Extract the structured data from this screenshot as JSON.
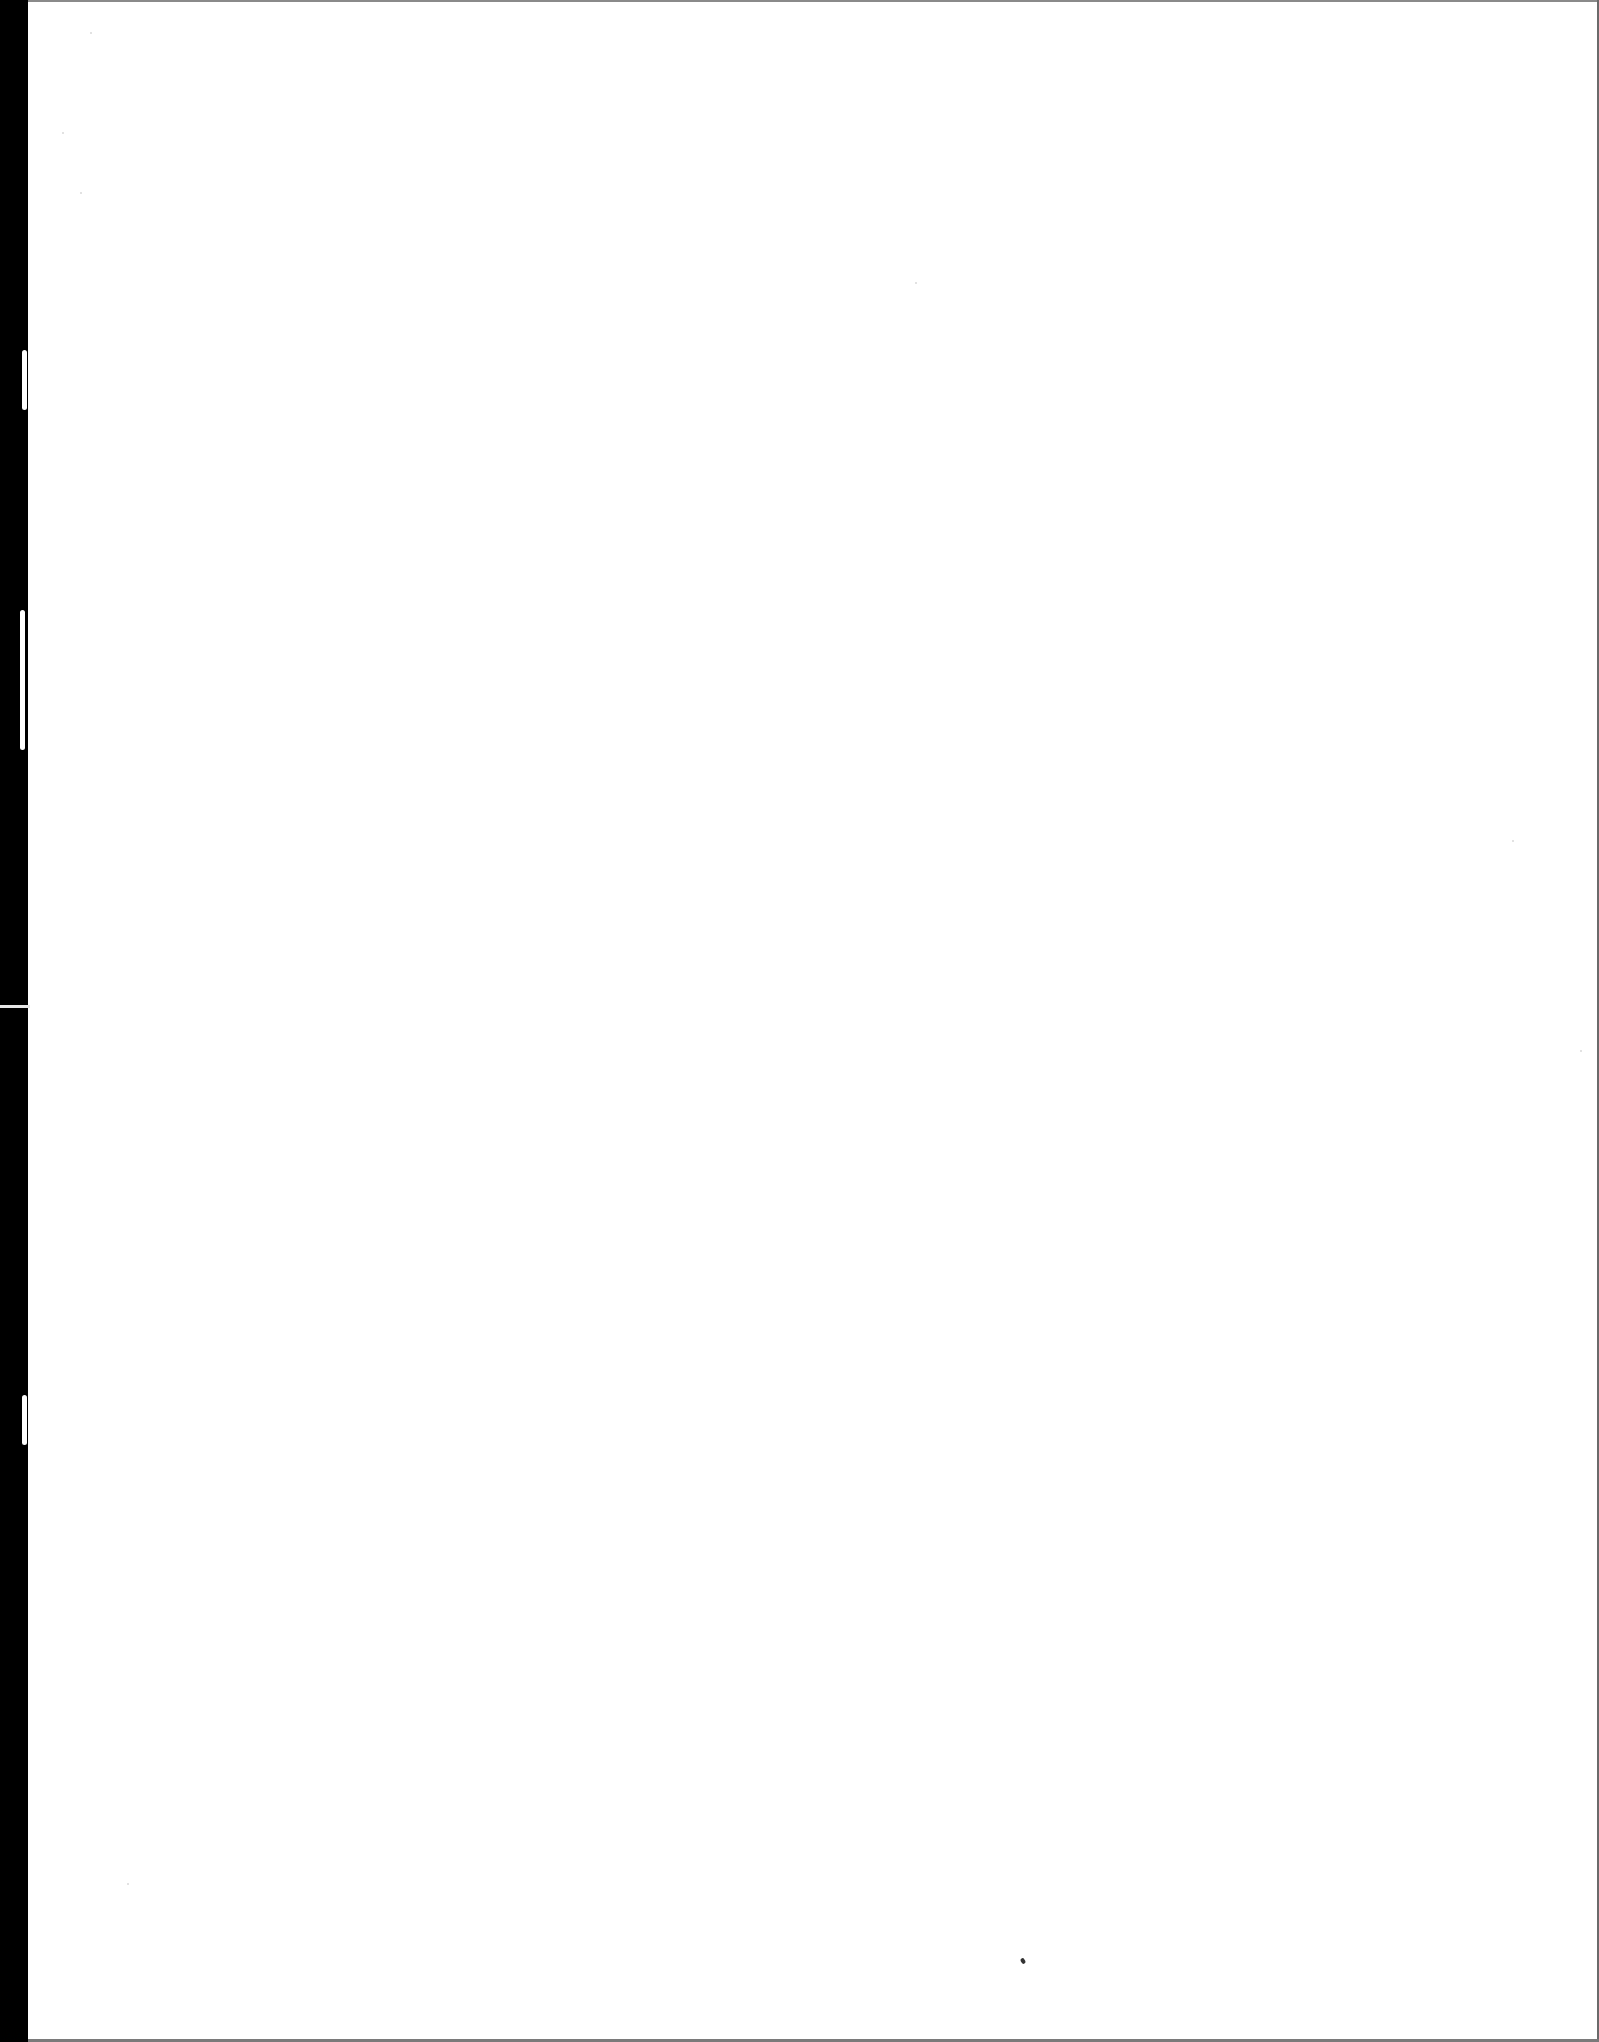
{
  "document": {
    "type": "scanned-page",
    "content_text": "",
    "is_blank": true
  },
  "colors": {
    "page_background": "#ffffff",
    "binding_edge": "#000000",
    "page_border": "#7a7a7a",
    "speck": "#333333"
  },
  "artifacts": {
    "binding_edge_notch_y": 1005,
    "speck": {
      "x": 1021,
      "y": 1960
    }
  }
}
